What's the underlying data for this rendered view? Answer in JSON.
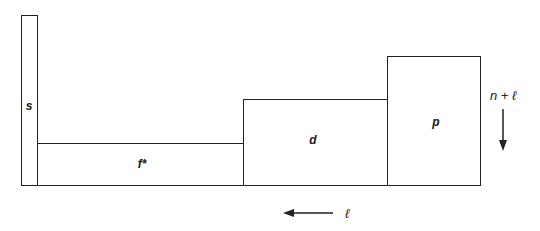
{
  "diagram": {
    "title": "",
    "blocks": [
      {
        "id": "s",
        "label": "s",
        "x": 21,
        "y": 15,
        "w": 17,
        "h": 171
      },
      {
        "id": "f",
        "label": "f*",
        "x": 37,
        "y": 143,
        "w": 207,
        "h": 43
      },
      {
        "id": "d",
        "label": "d",
        "x": 243,
        "y": 99,
        "w": 145,
        "h": 87
      },
      {
        "id": "p",
        "label": "p",
        "x": 387,
        "y": 56,
        "w": 94,
        "h": 130
      }
    ],
    "axes": {
      "vertical_label": "n + ℓ",
      "vertical_direction": "down",
      "horizontal_label": "ℓ",
      "horizontal_direction": "left"
    }
  }
}
